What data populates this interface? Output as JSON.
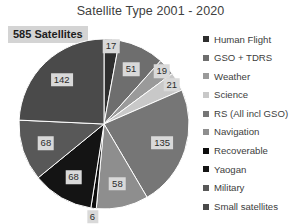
{
  "chart_data": {
    "type": "pie",
    "title": "Satellite Type 2001 - 2020",
    "xlabel": "",
    "ylabel": "",
    "legend_position": "right",
    "grid": false,
    "total_label": "585 Satellites",
    "total": 585,
    "categories": [
      "Human Flight",
      "GSO + TDRS",
      "Weather",
      "Science",
      "RS (All incl GSO)",
      "Navigation",
      "Recoverable",
      "Yaogan",
      "Military",
      "Small satellites"
    ],
    "values": [
      17,
      51,
      19,
      21,
      135,
      58,
      6,
      68,
      68,
      142
    ],
    "colors": [
      "#2e2e2e",
      "#6e6e6e",
      "#9a9a9a",
      "#c8c8c8",
      "#767676",
      "#8e8e8e",
      "#0d0d0d",
      "#141414",
      "#585858",
      "#4a4a4a"
    ],
    "slice_labels": [
      "17",
      "51",
      "19",
      "21",
      "135",
      "58",
      "6",
      "68",
      "68",
      "142"
    ]
  },
  "legend": {
    "items": [
      {
        "label": "Human Flight",
        "value": 17
      },
      {
        "label": "GSO + TDRS",
        "value": 51
      },
      {
        "label": "Weather",
        "value": 19
      },
      {
        "label": "Science",
        "value": 21
      },
      {
        "label": "RS (All incl GSO)",
        "value": 135
      },
      {
        "label": "Navigation",
        "value": 58
      },
      {
        "label": "Recoverable",
        "value": 6
      },
      {
        "label": "Yaogan",
        "value": 68
      },
      {
        "label": "Military",
        "value": 68
      },
      {
        "label": "Small satellites",
        "value": 142
      }
    ]
  },
  "style": {
    "background": "#ffffff",
    "label_background": "#d9d9d9",
    "badge_background": "#d4d4d4",
    "title_color": "#404040"
  }
}
